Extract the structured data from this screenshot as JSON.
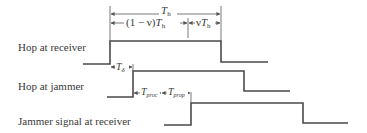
{
  "diagram": {
    "type": "timing-diagram",
    "rows": [
      {
        "label": "Hop at receiver",
        "rise_x": 110,
        "fall_x": 221
      },
      {
        "label": "Hop at jammer",
        "rise_x": 133,
        "fall_x": 244
      },
      {
        "label": "Jammer signal at receiver",
        "rise_x": 191,
        "fall_x": 303
      }
    ],
    "annotations": {
      "total_period": {
        "symbol": "T",
        "subscript": "h"
      },
      "first_portion": {
        "prefix": "(1 − ν)",
        "symbol": "T",
        "subscript": "h"
      },
      "second_portion": {
        "prefix": "ν",
        "symbol": "T",
        "subscript": "h"
      },
      "delay": {
        "symbol": "T",
        "subscript": "δ"
      },
      "processing": {
        "symbol": "T",
        "subscript": "proc"
      },
      "propagation": {
        "symbol": "T",
        "subscript": "prop"
      }
    }
  }
}
